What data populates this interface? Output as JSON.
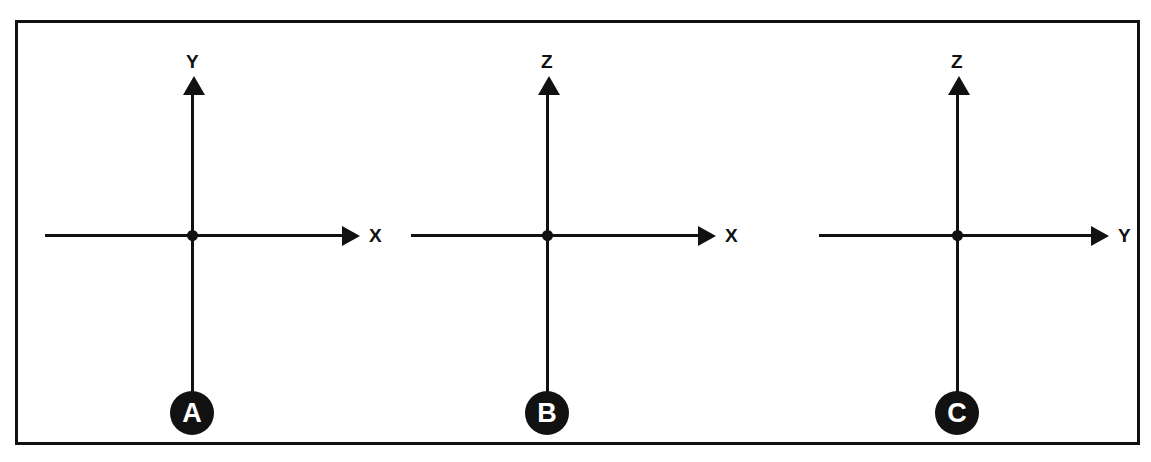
{
  "figure": {
    "border_color": "#111111",
    "ink_color": "#111111",
    "background_color": "#ffffff",
    "panel_count": 3
  },
  "panels": [
    {
      "badge": "A",
      "vertical_axis_label": "Y",
      "horizontal_axis_label": "X",
      "origin_label": "",
      "description": "Y vertical axis, X horizontal axis"
    },
    {
      "badge": "B",
      "vertical_axis_label": "Z",
      "horizontal_axis_label": "X",
      "origin_label": "",
      "description": "Z vertical axis, X horizontal axis"
    },
    {
      "badge": "C",
      "vertical_axis_label": "Z",
      "horizontal_axis_label": "Y",
      "origin_label": "",
      "description": "Z vertical axis, Y horizontal axis"
    }
  ],
  "icons": {
    "arrow_up": "arrow-up-icon",
    "arrow_right": "arrow-right-icon",
    "origin": "origin-dot-icon"
  }
}
